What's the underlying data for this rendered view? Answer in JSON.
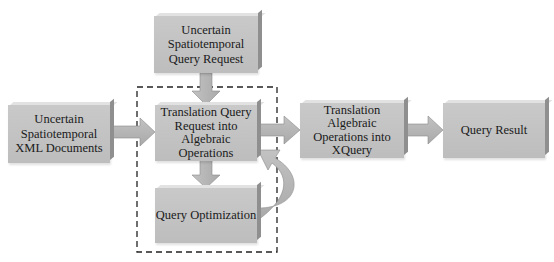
{
  "diagram": {
    "nodes": {
      "request": "Uncertain Spatiotemporal Query Request",
      "request_lines": [
        "Uncertain",
        "Spatiotemporal",
        "Query Request"
      ],
      "documents_lines": [
        "Uncertain",
        "Spatiotemporal",
        "XML Documents"
      ],
      "translation_lines": [
        "Translation Query",
        "Request into",
        "Algebraic",
        "Operations"
      ],
      "optimization": "Query Optimization",
      "xquery_lines": [
        "Translation",
        "Algebraic",
        "Operations into",
        "XQuery"
      ],
      "result": "Query Result"
    },
    "colors": {
      "box_fill": "#c4c4c4",
      "arrow_fill": "#b5b5b5",
      "dashed_border": "#222222"
    }
  }
}
